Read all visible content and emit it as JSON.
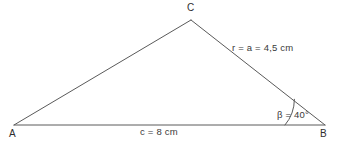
{
  "figure": {
    "type": "triangle-diagram",
    "background_color": "#ffffff",
    "stroke_color": "#5a5a5a",
    "text_color": "#3a3a3a",
    "width": 341,
    "height": 147
  },
  "vertices": {
    "A": {
      "label": "A",
      "x": 14,
      "y": 125
    },
    "B": {
      "label": "B",
      "x": 325,
      "y": 125
    },
    "C": {
      "label": "C",
      "x": 191,
      "y": 20
    }
  },
  "sides": {
    "a": {
      "label": "r = a = 4,5 cm",
      "from": "B",
      "to": "C",
      "value": "4,5",
      "unit": "cm"
    },
    "c": {
      "label": "c = 8 cm",
      "from": "A",
      "to": "B",
      "value": "8",
      "unit": "cm"
    },
    "b": {
      "label": "",
      "from": "A",
      "to": "C"
    }
  },
  "angles": {
    "beta": {
      "label": "β = 40°",
      "at": "B",
      "value": "40",
      "unit": "°"
    }
  }
}
